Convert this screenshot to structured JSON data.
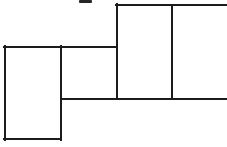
{
  "figure": {
    "canvas": {
      "width": 227,
      "height": 147
    },
    "background_color": "#ffffff",
    "line_color": "#1c1c1c",
    "line_width": 2,
    "shapes": [
      {
        "name": "left-lower-rectangle",
        "kind": "rectangle",
        "x": 4,
        "y": 46,
        "width": 57,
        "height": 94,
        "clipped": false
      },
      {
        "name": "middle-rectangle",
        "kind": "rectangle",
        "x": 61,
        "y": 46,
        "width": 55,
        "height": 53,
        "clipped": false
      },
      {
        "name": "upper-right-rectangle",
        "kind": "rectangle",
        "x": 116,
        "y": 4,
        "width": 111,
        "height": 95,
        "clipped": true,
        "clipped_side": "right"
      }
    ],
    "segments": [
      {
        "name": "upper-right-top-edge",
        "x1": 116,
        "y1": 5,
        "x2": 227,
        "y2": 5
      },
      {
        "name": "upper-right-left-edge",
        "x1": 117,
        "y1": 4,
        "x2": 117,
        "y2": 99
      },
      {
        "name": "upper-right-inner-divider",
        "x1": 172,
        "y1": 5,
        "x2": 172,
        "y2": 99
      },
      {
        "name": "middle-top-edge",
        "x1": 61,
        "y1": 47,
        "x2": 117,
        "y2": 47
      },
      {
        "name": "left-rectangle-top-edge",
        "x1": 4,
        "y1": 47,
        "x2": 61,
        "y2": 47
      },
      {
        "name": "left-rectangle-left-edge",
        "x1": 5,
        "y1": 46,
        "x2": 5,
        "y2": 140
      },
      {
        "name": "left-rectangle-right-edge",
        "x1": 61,
        "y1": 46,
        "x2": 61,
        "y2": 140
      },
      {
        "name": "left-rectangle-bottom-edge",
        "x1": 4,
        "y1": 139,
        "x2": 61,
        "y2": 139
      },
      {
        "name": "mid-horizontal-edge",
        "x1": 61,
        "y1": 99,
        "x2": 227,
        "y2": 99
      }
    ],
    "artifact": {
      "name": "ink-smudge",
      "kind": "scan-artifact",
      "x": 79,
      "y": 0,
      "width": 13,
      "height": 3,
      "color": "#262626"
    }
  }
}
